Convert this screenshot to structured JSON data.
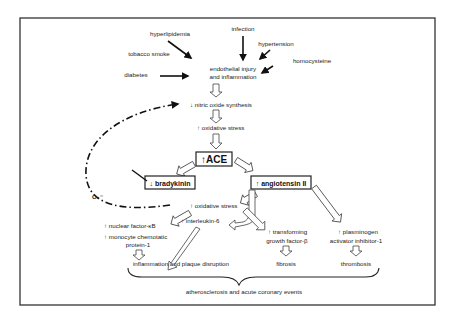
{
  "diagram": {
    "risk_factors": {
      "infection": "infection",
      "hyperlipidemia": "hyperlipidemia",
      "hypertension": "hypertension",
      "tobacco_smoke": "tobacco smoke",
      "homocysteine": "homocysteine",
      "diabetes": "diabetes"
    },
    "central": {
      "endothelial_line1": "endothelial injury",
      "endothelial_line2": "and inflammation",
      "nitric_oxide": "↓ nitric oxide synthesis",
      "oxidative_stress_1": "↑ oxidative stress",
      "ace": "↑ACE"
    },
    "branches": {
      "bradykinin": "↓ bradykinin",
      "angiotensin": "↑ angiotensin II",
      "o2_label": "O₂⁻",
      "oxidative_stress_2": "↑ oxidative stress",
      "interleukin": "↑ interleukin-6",
      "nfkb": "↑ nuclear factor-κB",
      "mcp_line1": "↑ monocyte chemotatic",
      "mcp_line2": "protein-1",
      "tgf_line1": "↑ transforming",
      "tgf_line2": "growth factor-β",
      "pai_line1": "↑ plasminogen",
      "pai_line2": "activator inhibitor-1"
    },
    "outcomes": {
      "inflammation": "inflammation and plaque disruption",
      "fibrosis": "fibrosis",
      "thrombosis": "thrombosis",
      "final": "atherosclerosis and acute coronary events"
    }
  }
}
